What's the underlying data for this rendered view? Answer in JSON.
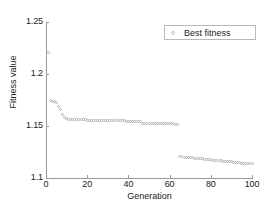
{
  "chart_data": {
    "type": "scatter",
    "title": "",
    "xlabel": "Generation",
    "ylabel": "Fitness value",
    "xlim": [
      0,
      100
    ],
    "ylim": [
      1.1,
      1.25
    ],
    "xticks": [
      0,
      20,
      40,
      60,
      80,
      100
    ],
    "yticks": [
      1.1,
      1.15,
      1.2,
      1.25
    ],
    "xtick_labels": [
      "0",
      "20",
      "40",
      "60",
      "80",
      "100"
    ],
    "ytick_labels": [
      "1.1",
      "1.15",
      "1.2",
      "1.25"
    ],
    "grid": false,
    "legend_position": "top-right",
    "marker": "open-circle",
    "marker_color": "#b4b4b4",
    "series": [
      {
        "name": "Best fitness",
        "x": [
          1,
          2,
          3,
          4,
          5,
          6,
          7,
          8,
          9,
          10,
          11,
          12,
          13,
          14,
          15,
          16,
          17,
          18,
          19,
          20,
          21,
          22,
          23,
          24,
          25,
          26,
          27,
          28,
          29,
          30,
          31,
          32,
          33,
          34,
          35,
          36,
          37,
          38,
          39,
          40,
          41,
          42,
          43,
          44,
          45,
          46,
          47,
          48,
          49,
          50,
          51,
          52,
          53,
          54,
          55,
          56,
          57,
          58,
          59,
          60,
          61,
          62,
          63,
          64,
          65,
          66,
          67,
          68,
          69,
          70,
          71,
          72,
          73,
          74,
          75,
          76,
          77,
          78,
          79,
          80,
          81,
          82,
          83,
          84,
          85,
          86,
          87,
          88,
          89,
          90,
          91,
          92,
          93,
          94,
          95,
          96,
          97,
          98,
          99,
          100
        ],
        "y": [
          1.221,
          1.1745,
          1.174,
          1.1735,
          1.173,
          1.169,
          1.1655,
          1.161,
          1.158,
          1.1568,
          1.1565,
          1.1563,
          1.1562,
          1.1561,
          1.156,
          1.1559,
          1.1559,
          1.1558,
          1.1558,
          1.1557,
          1.1557,
          1.1556,
          1.1556,
          1.1556,
          1.1555,
          1.1555,
          1.1554,
          1.1554,
          1.1553,
          1.1553,
          1.1552,
          1.1552,
          1.1551,
          1.1551,
          1.155,
          1.155,
          1.1549,
          1.1549,
          1.1548,
          1.1548,
          1.1547,
          1.1547,
          1.1546,
          1.1546,
          1.1545,
          1.1545,
          1.1528,
          1.1526,
          1.1525,
          1.1525,
          1.1524,
          1.1524,
          1.1523,
          1.1523,
          1.1523,
          1.1522,
          1.1522,
          1.1521,
          1.1521,
          1.152,
          1.152,
          1.152,
          1.1519,
          1.1519,
          1.1205,
          1.1203,
          1.1201,
          1.1199,
          1.1197,
          1.1195,
          1.1193,
          1.1191,
          1.1189,
          1.1187,
          1.1185,
          1.1183,
          1.1181,
          1.1179,
          1.1177,
          1.1175,
          1.1173,
          1.1171,
          1.1169,
          1.1167,
          1.1165,
          1.1163,
          1.116,
          1.1158,
          1.1156,
          1.1154,
          1.1152,
          1.115,
          1.1148,
          1.1146,
          1.1144,
          1.1142,
          1.114,
          1.1139,
          1.1137,
          1.1135
        ]
      }
    ]
  },
  "legend": {
    "label": "Best fitness",
    "marker_icon": "open-circle-marker-icon"
  }
}
